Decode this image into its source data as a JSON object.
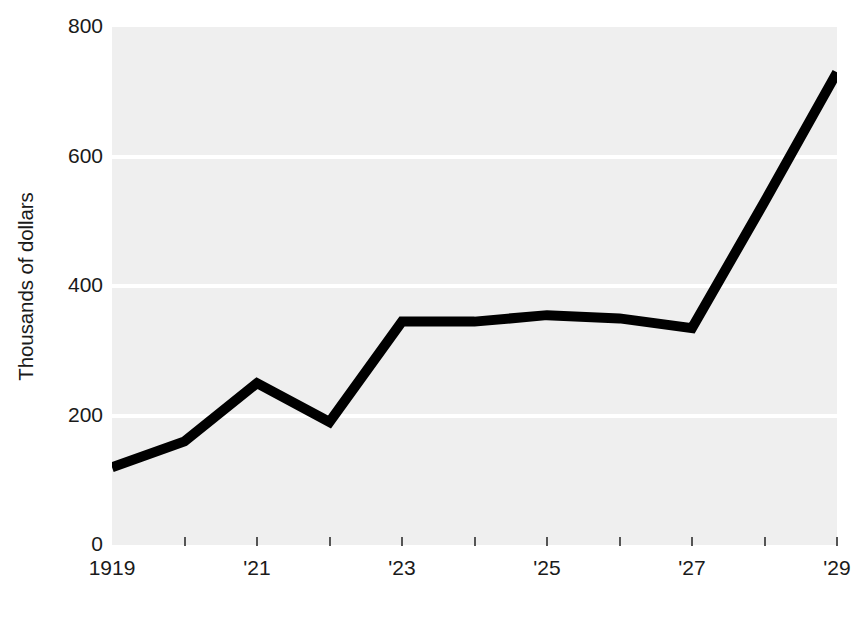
{
  "chart_data": {
    "type": "line",
    "title": "",
    "subtitle": "",
    "xlabel": "",
    "ylabel": "Thousands of dollars",
    "x": [
      1919,
      1920,
      1921,
      1922,
      1923,
      1924,
      1925,
      1926,
      1927,
      1928,
      1929
    ],
    "values": [
      120,
      160,
      250,
      190,
      345,
      345,
      355,
      350,
      335,
      530,
      730
    ],
    "series": [
      {
        "name": "Thousands of dollars",
        "values": [
          120,
          160,
          250,
          190,
          345,
          345,
          355,
          350,
          335,
          530,
          730
        ]
      }
    ],
    "xlim": [
      1919,
      1929
    ],
    "ylim": [
      0,
      800
    ],
    "y_ticks": [
      0,
      200,
      400,
      600,
      800
    ],
    "y_tick_labels": [
      "0",
      "200",
      "400",
      "600",
      "800"
    ],
    "x_ticks": [
      1919,
      1920,
      1921,
      1922,
      1923,
      1924,
      1925,
      1926,
      1927,
      1928,
      1929
    ],
    "x_tick_labels": [
      "1919",
      "",
      "'21",
      "",
      "'23",
      "",
      "'25",
      "",
      "'27",
      "",
      "'29"
    ],
    "grid": "horizontal-white-on-gray",
    "legend": "none",
    "line_color": "#000000",
    "line_width": 10,
    "plot_background": "#efefef",
    "gridline_color": "#ffffff",
    "figure_background": "#ffffff",
    "text_color": "#1a1a1a"
  },
  "axes": {
    "y_title": "Thousands of dollars",
    "y_labels": [
      {
        "text": "800",
        "value": 800
      },
      {
        "text": "600",
        "value": 600
      },
      {
        "text": "400",
        "value": 400
      },
      {
        "text": "200",
        "value": 200
      },
      {
        "text": "0",
        "value": 0
      }
    ],
    "x_labels": [
      {
        "text": "1919",
        "value": 1919
      },
      {
        "text": "'21",
        "value": 1921
      },
      {
        "text": "'23",
        "value": 1923
      },
      {
        "text": "'25",
        "value": 1925
      },
      {
        "text": "'27",
        "value": 1927
      },
      {
        "text": "'29",
        "value": 1929
      }
    ]
  }
}
